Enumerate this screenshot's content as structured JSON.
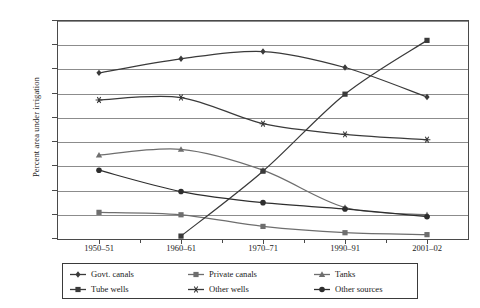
{
  "chart_data": {
    "type": "line",
    "title": "",
    "xlabel": "",
    "ylabel": "Percent area under irrigation",
    "categories": [
      "1950–51",
      "1960–61",
      "1970–71",
      "1990–91",
      "2001–02"
    ],
    "ylim": [
      0,
      45
    ],
    "ytick_step": 5,
    "yticks": [
      "0",
      "5",
      "10",
      "15",
      "20",
      "25",
      "30",
      "35",
      "40",
      "45"
    ],
    "grid": true,
    "legend_position": "bottom",
    "series": [
      {
        "name": "Govt. canals",
        "marker": "diamond",
        "color": "#3a3a3a",
        "values": [
          34.3,
          37.2,
          38.7,
          35.4,
          29.3
        ]
      },
      {
        "name": "Private canals",
        "marker": "square",
        "color": "#6e6e6e",
        "values": [
          5.5,
          5.0,
          2.6,
          1.3,
          0.9
        ]
      },
      {
        "name": "Tanks",
        "marker": "triangle",
        "color": "#6e6e6e",
        "values": [
          17.3,
          18.5,
          14.2,
          6.5,
          5.0
        ]
      },
      {
        "name": "Tube wells",
        "marker": "square",
        "color": "#3a3a3a",
        "values": [
          null,
          0.6,
          14.0,
          29.9,
          41.0
        ]
      },
      {
        "name": "Other wells",
        "marker": "star",
        "color": "#3a3a3a",
        "values": [
          28.7,
          29.2,
          23.8,
          21.6,
          20.5
        ]
      },
      {
        "name": "Other sources",
        "marker": "circle",
        "color": "#2e2e2e",
        "values": [
          14.2,
          9.8,
          7.5,
          6.2,
          4.6
        ]
      }
    ]
  },
  "legend": {
    "entries": [
      {
        "label": "Govt. canals"
      },
      {
        "label": "Private canals"
      },
      {
        "label": "Tanks"
      },
      {
        "label": "Tube wells"
      },
      {
        "label": "Other wells"
      },
      {
        "label": "Other sources"
      }
    ]
  }
}
